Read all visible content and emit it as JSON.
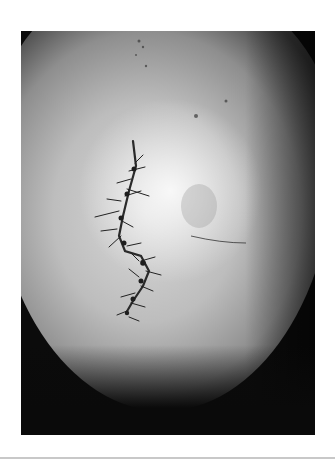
{
  "image": {
    "subject": "sutured scalp laceration",
    "description": "Grayscale clinical photograph of a scalp showing a zig-zag sutured wound near the vertex",
    "colors": {
      "background": "#ffffff",
      "frame": "#0b0b0b",
      "skin_light": "#d9d9d9",
      "skin_mid": "#8e8e8e",
      "suture": "#2a2a2a",
      "bottom_rule": "#c8c8c8"
    }
  }
}
